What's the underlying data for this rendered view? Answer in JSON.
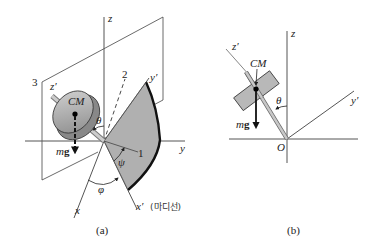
{
  "figure_a": {
    "caption": "(a)",
    "axes": {
      "z": "z",
      "y": "y",
      "x": "x",
      "x_prime": "x′",
      "y_prime": "y′",
      "z_prime": "z′"
    },
    "lines": {
      "line1": "1",
      "line2": "2",
      "line3": "3"
    },
    "cm_label": "CM",
    "weight_label_m": "m",
    "weight_label_g": "g",
    "angles": {
      "theta": "θ",
      "psi": "ψ",
      "phi": "φ"
    },
    "nodal_line_label": "(마디선)"
  },
  "figure_b": {
    "caption": "(b)",
    "axes": {
      "z": "z",
      "y_prime": "y′",
      "z_prime": "z′"
    },
    "origin_label": "O",
    "cm_label": "CM",
    "weight_label_m": "m",
    "weight_label_g": "g",
    "angles": {
      "theta": "θ"
    }
  },
  "colors": {
    "disk_fill": "#b8b8b8",
    "sector_fill": "#b0b0b0",
    "line": "#444444"
  }
}
